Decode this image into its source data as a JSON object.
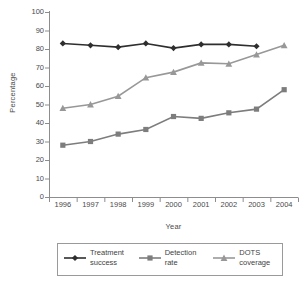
{
  "chart_data": {
    "type": "line",
    "title": "",
    "xlabel": "Year",
    "ylabel": "Percentage",
    "categories": [
      "1996",
      "1997",
      "1998",
      "1999",
      "2000",
      "2001",
      "2002",
      "2003",
      "2004"
    ],
    "ylim": [
      0,
      100
    ],
    "yticks": [
      0,
      10,
      20,
      30,
      40,
      50,
      60,
      70,
      80,
      90,
      100
    ],
    "grid": false,
    "legend_position": "bottom",
    "series": [
      {
        "name": "Treatment success",
        "legend_label": "Treatment\nsuccess",
        "marker": "diamond",
        "color": "#2e2e2e",
        "x": [
          "1996",
          "1997",
          "1998",
          "1999",
          "2000",
          "2001",
          "2002",
          "2003"
        ],
        "values": [
          83,
          82,
          81,
          83,
          80.5,
          82.5,
          82.5,
          81.5
        ]
      },
      {
        "name": "Detection rate",
        "legend_label": "Detection\nrate",
        "marker": "square",
        "color": "#7d7d7d",
        "x": [
          "1996",
          "1997",
          "1998",
          "1999",
          "2000",
          "2001",
          "2002",
          "2003",
          "2004"
        ],
        "values": [
          28,
          30,
          34,
          36.5,
          43.5,
          42.5,
          45.5,
          47.5,
          58
        ]
      },
      {
        "name": "DOTS coverage",
        "legend_label": "DOTS\ncoverage",
        "marker": "triangle",
        "color": "#989898",
        "x": [
          "1996",
          "1997",
          "1998",
          "1999",
          "2000",
          "2001",
          "2002",
          "2003",
          "2004"
        ],
        "values": [
          48,
          50,
          54.5,
          64.5,
          67.5,
          72.5,
          72,
          77,
          82
        ]
      }
    ]
  },
  "axes": {
    "axis_color": "#8d8d8d",
    "background": "#ffffff"
  },
  "legend": {
    "border_color": "#9a9a9a",
    "items": [
      {
        "label": "Treatment\nsuccess",
        "color": "#2e2e2e",
        "marker": "diamond"
      },
      {
        "label": "Detection\nrate",
        "color": "#7d7d7d",
        "marker": "square"
      },
      {
        "label": "DOTS\ncoverage",
        "color": "#989898",
        "marker": "triangle"
      }
    ]
  }
}
